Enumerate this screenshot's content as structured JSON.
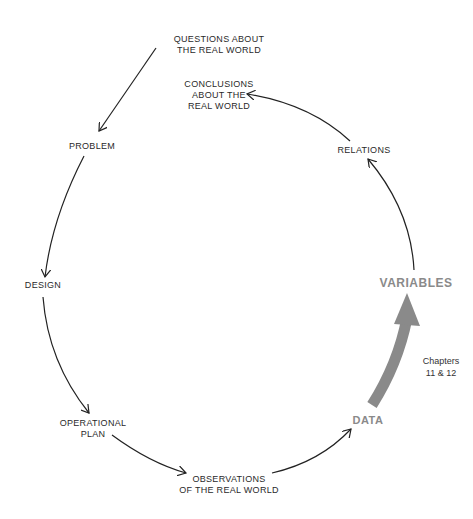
{
  "diagram": {
    "nodes": {
      "questions": {
        "line1": "QUESTIONS ABOUT",
        "line2": "THE REAL WORLD"
      },
      "conclusions": {
        "line1": "CONCLUSIONS",
        "line2": "ABOUT  THE",
        "line3": "REAL WORLD"
      },
      "problem": {
        "label": "PROBLEM"
      },
      "relations": {
        "label": "RELATIONS"
      },
      "design": {
        "label": "DESIGN"
      },
      "variables": {
        "label": "VARIABLES"
      },
      "operational_plan": {
        "line1": "OPERATIONAL",
        "line2": "PLAN"
      },
      "data": {
        "label": "DATA"
      },
      "observations": {
        "line1": "OBSERVATIONS",
        "line2": "OF THE REAL WORLD"
      }
    },
    "highlight_note": {
      "line1": "Chapters",
      "line2": "11  &  12"
    },
    "edges": [
      {
        "from": "questions",
        "to": "problem"
      },
      {
        "from": "problem",
        "to": "design"
      },
      {
        "from": "design",
        "to": "operational_plan"
      },
      {
        "from": "operational_plan",
        "to": "observations"
      },
      {
        "from": "observations",
        "to": "data"
      },
      {
        "from": "data",
        "to": "variables",
        "highlighted": true
      },
      {
        "from": "variables",
        "to": "relations"
      },
      {
        "from": "relations",
        "to": "conclusions"
      }
    ],
    "colors": {
      "line": "#222222",
      "highlight": "#8a8a8a",
      "text": "#2a2a2a"
    }
  }
}
